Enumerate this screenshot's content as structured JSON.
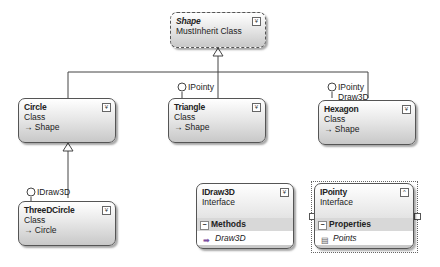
{
  "diagram": {
    "shape": {
      "name": "Shape",
      "kind": "MustInherit Class",
      "toggle": "¥"
    },
    "circle": {
      "name": "Circle",
      "kind": "Class",
      "base": "→ Shape",
      "toggle": "¥"
    },
    "triangle": {
      "name": "Triangle",
      "kind": "Class",
      "base": "→ Shape",
      "toggle": "¥",
      "lollipop": "IPointy"
    },
    "hexagon": {
      "name": "Hexagon",
      "kind": "Class",
      "base": "→ Shape",
      "toggle": "¥",
      "lollipop": [
        "IPointy",
        "Draw3D"
      ]
    },
    "threedcircle": {
      "name": "ThreeDCircle",
      "kind": "Class",
      "base": "→ Circle",
      "toggle": "¥",
      "lollipop": "IDraw3D"
    },
    "idraw3d": {
      "name": "IDraw3D",
      "kind": "Interface",
      "toggle": "¥",
      "section": "Methods",
      "members": [
        "Draw3D"
      ]
    },
    "ipointy": {
      "name": "IPointy",
      "kind": "Interface",
      "toggle": "^",
      "section": "Properties",
      "members": [
        "Points"
      ]
    }
  }
}
